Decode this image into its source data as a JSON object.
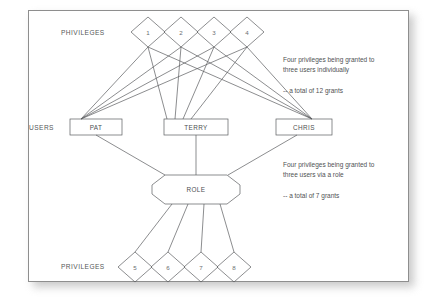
{
  "figure": {
    "row_labels": {
      "top_privileges": "PHIVILEGES",
      "users": "USERS",
      "bottom_privileges": "PRIVILEGES"
    },
    "top_privileges": [
      {
        "id": "p1",
        "label": "1"
      },
      {
        "id": "p2",
        "label": "2"
      },
      {
        "id": "p3",
        "label": "3"
      },
      {
        "id": "p4",
        "label": "4"
      }
    ],
    "users": [
      {
        "id": "pat",
        "label": "PAT"
      },
      {
        "id": "terry",
        "label": "TERRY"
      },
      {
        "id": "chris",
        "label": "CHRIS"
      }
    ],
    "role": {
      "id": "role",
      "label": "ROLE"
    },
    "bottom_privileges": [
      {
        "id": "p5",
        "label": "5"
      },
      {
        "id": "p6",
        "label": "6"
      },
      {
        "id": "p7",
        "label": "7"
      },
      {
        "id": "p8",
        "label": "8"
      }
    ],
    "annotations": {
      "individual_line1": "Four privileges being granted to",
      "individual_line2": "three users individually",
      "individual_total": "-- a total of 12 grants",
      "role_line1": "Four privileges being granted to",
      "role_line2": "three users via a role",
      "role_total": "-- a total of 7 grants"
    },
    "colors": {
      "frame_border": "#8e8e8e",
      "line": "#5a5c5e",
      "text": "#4f5153",
      "background": "#ffffff"
    },
    "edge_counts": {
      "direct_grants": 12,
      "role_grants": 7
    }
  }
}
